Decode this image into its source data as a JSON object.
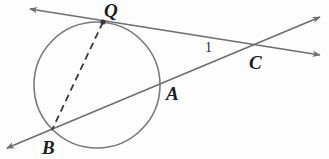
{
  "figure": {
    "kind": "geometry-diagram",
    "width": 329,
    "height": 159,
    "background_color": "#fdfdfd",
    "stroke_color": "#6f6f6f",
    "dash_color": "#3a3a3a",
    "label_color": "#1c1c1c"
  },
  "circle": {
    "name": "main-circle",
    "cx": 97,
    "cy": 85,
    "r": 63,
    "stroke": "#7a7a7a",
    "stroke_width": 1.6,
    "fill": "none"
  },
  "points": [
    {
      "id": "Q",
      "label": "Q",
      "x": 103,
      "y": 22,
      "label_x": 104,
      "label_y": 1,
      "dotted": true
    },
    {
      "id": "B",
      "label": "B",
      "x": 52,
      "y": 130,
      "label_x": 42,
      "label_y": 138,
      "dotted": false
    },
    {
      "id": "A",
      "label": "A",
      "x": 160,
      "y": 86,
      "label_x": 166,
      "label_y": 84,
      "dotted": false
    },
    {
      "id": "C",
      "label": "C",
      "x": 257,
      "y": 46,
      "label_x": 249,
      "label_y": 53,
      "dotted": false
    }
  ],
  "angle_labels": [
    {
      "id": "angle-1",
      "text": "1",
      "x": 205,
      "y": 41
    }
  ],
  "lines": [
    {
      "id": "tangent-line-QC",
      "style": "solid",
      "x1": 30,
      "y1": 9,
      "x2": 320,
      "y2": 55,
      "arrow_start": true,
      "arrow_end": true
    },
    {
      "id": "secant-line-BAC",
      "style": "solid",
      "x1": 7,
      "y1": 148,
      "x2": 320,
      "y2": 17,
      "arrow_start": true,
      "arrow_end": true
    },
    {
      "id": "chord-QB",
      "style": "dashed",
      "x1": 103,
      "y1": 22,
      "x2": 52,
      "y2": 130,
      "arrow_start": false,
      "arrow_end": false
    }
  ]
}
